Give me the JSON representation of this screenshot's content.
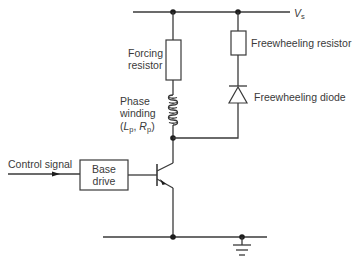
{
  "diagram": {
    "type": "circuit-schematic",
    "supply": {
      "symbol": "V",
      "subscript": "s"
    },
    "components": {
      "forcing_resistor": [
        "Forcing",
        "resistor"
      ],
      "phase_winding": [
        "Phase",
        "winding"
      ],
      "phase_winding_params": {
        "open": "(",
        "L": "L",
        "L_sub": "p",
        "sep": ", ",
        "R": "R",
        "R_sub": "p",
        "close": ")"
      },
      "freewheeling_resistor": "Freewheeling resistor",
      "freewheeling_diode": "Freewheeling diode",
      "base_drive": [
        "Base",
        "drive"
      ],
      "control_signal": "Control signal"
    },
    "colors": {
      "line": "#3a3a3a",
      "node": "#1e1e1e",
      "background": "#ffffff"
    }
  }
}
